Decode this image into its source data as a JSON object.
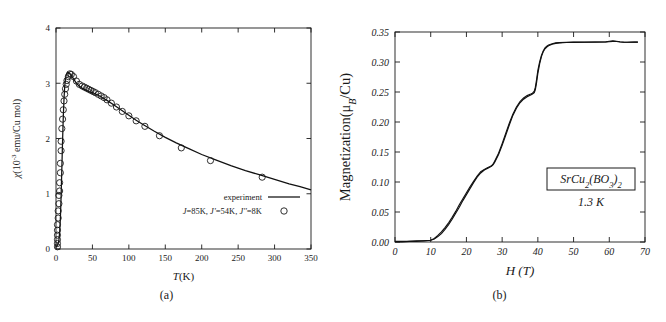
{
  "figure": {
    "panels": [
      {
        "caption": "(a)"
      },
      {
        "caption": "(b)"
      }
    ]
  },
  "chart_data": [
    {
      "type": "line",
      "panel": "(a)",
      "title": "",
      "xlabel": "T(K)",
      "ylabel": "χ(10⁻³ emu/Cu mol)",
      "ylabel_parts": {
        "symbol": "χ",
        "rest": "(10",
        "exponent": "-3",
        "tail": " emu/Cu mol)"
      },
      "xlim": [
        0,
        350
      ],
      "ylim": [
        0,
        4
      ],
      "xticks": [
        0,
        50,
        100,
        150,
        200,
        250,
        300,
        350
      ],
      "yticks": [
        0,
        1,
        2,
        3,
        4
      ],
      "grid": false,
      "legend_position": "lower-right",
      "legend": [
        {
          "label": "experiment",
          "marker": "line"
        },
        {
          "label": "J=85K, J'=54K, J''=8K",
          "marker": "circle"
        }
      ],
      "series": [
        {
          "name": "experiment",
          "style": "solid-line",
          "x": [
            0,
            1,
            2,
            3,
            4,
            5,
            6,
            7,
            8,
            9,
            10,
            11,
            12,
            13,
            14,
            15,
            16,
            18,
            20,
            22,
            25,
            28,
            31,
            35,
            40,
            45,
            50,
            55,
            60,
            65,
            70,
            80,
            90,
            100,
            110,
            120,
            135,
            150,
            165,
            180,
            200,
            220,
            240,
            260,
            280,
            300,
            320,
            335,
            350
          ],
          "y": [
            0.04,
            0.05,
            0.07,
            0.1,
            0.16,
            0.3,
            0.55,
            0.95,
            1.45,
            1.95,
            2.4,
            2.72,
            2.95,
            3.08,
            3.15,
            3.18,
            3.2,
            3.19,
            3.16,
            3.12,
            3.06,
            3.0,
            2.96,
            2.92,
            2.88,
            2.85,
            2.83,
            2.8,
            2.77,
            2.73,
            2.69,
            2.6,
            2.51,
            2.42,
            2.33,
            2.25,
            2.13,
            2.02,
            1.92,
            1.83,
            1.71,
            1.61,
            1.51,
            1.42,
            1.34,
            1.26,
            1.18,
            1.13,
            1.07
          ]
        },
        {
          "name": "J=85K, J'=54K, J''=8K",
          "style": "open-circles",
          "x": [
            2,
            2,
            2,
            2,
            2,
            2,
            3,
            3,
            4,
            4,
            5,
            5,
            6,
            6,
            7,
            7,
            8,
            9,
            10,
            11,
            12,
            13,
            14,
            15,
            17,
            19,
            21,
            24,
            28,
            32,
            36,
            39,
            42,
            45,
            48,
            51,
            54,
            58,
            62,
            66,
            70,
            76,
            83,
            91,
            100,
            110,
            122,
            142,
            172,
            212,
            283
          ],
          "y": [
            0.04,
            0.1,
            0.17,
            0.25,
            0.34,
            0.44,
            0.56,
            0.69,
            0.82,
            0.97,
            1.05,
            1.2,
            1.38,
            1.55,
            1.78,
            1.95,
            2.18,
            2.35,
            2.52,
            2.68,
            2.8,
            2.9,
            2.98,
            3.05,
            3.12,
            3.17,
            3.16,
            3.12,
            3.04,
            2.98,
            2.95,
            2.93,
            2.91,
            2.89,
            2.87,
            2.85,
            2.83,
            2.8,
            2.77,
            2.74,
            2.7,
            2.64,
            2.57,
            2.49,
            2.41,
            2.32,
            2.22,
            2.05,
            1.83,
            1.6,
            1.3
          ]
        }
      ]
    },
    {
      "type": "line",
      "panel": "(b)",
      "title": "",
      "xlabel": "H (T)",
      "ylabel": "Magnetization(μ_B/Cu)",
      "ylabel_parts": {
        "head": "Magnetization(",
        "mu": "μ",
        "sub": "B",
        "tail": "/Cu)"
      },
      "xlim": [
        0,
        70
      ],
      "ylim": [
        0.0,
        0.35
      ],
      "xticks": [
        0,
        10,
        20,
        30,
        40,
        50,
        60,
        70
      ],
      "yticks": [
        "0.00",
        "0.05",
        "0.10",
        "0.15",
        "0.20",
        "0.25",
        "0.30",
        "0.35"
      ],
      "ytick_values": [
        0.0,
        0.05,
        0.1,
        0.15,
        0.2,
        0.25,
        0.3,
        0.35
      ],
      "grid": false,
      "annotations": [
        {
          "text": "SrCu2(BO3)2",
          "boxed": true,
          "formula": [
            {
              "t": "SrCu",
              "sub": false
            },
            {
              "t": "2",
              "sub": true
            },
            {
              "t": "(BO",
              "sub": false
            },
            {
              "t": "3",
              "sub": true
            },
            {
              "t": ")",
              "sub": false
            },
            {
              "t": "2",
              "sub": true
            }
          ]
        },
        {
          "text": "1.3 K",
          "boxed": false
        }
      ],
      "series": [
        {
          "name": "up-sweep",
          "style": "solid-line",
          "x": [
            0,
            2,
            4,
            6,
            8,
            10,
            11,
            12,
            13,
            14,
            15,
            16,
            17,
            18,
            19,
            20,
            21,
            22,
            23,
            24,
            25,
            26,
            26.5,
            27,
            27.5,
            28,
            29,
            30,
            31,
            32,
            33,
            34,
            35,
            36,
            37,
            38,
            38.5,
            39,
            39.3,
            39.6,
            40,
            40.5,
            41,
            41.5,
            42,
            42.5,
            43,
            44,
            45,
            46,
            48,
            50,
            53,
            56,
            59,
            60,
            61,
            62,
            63,
            64,
            65,
            66,
            67,
            68
          ],
          "y": [
            0.001,
            0.001,
            0.001,
            0.002,
            0.002,
            0.003,
            0.005,
            0.009,
            0.014,
            0.021,
            0.029,
            0.038,
            0.048,
            0.058,
            0.069,
            0.079,
            0.089,
            0.099,
            0.108,
            0.115,
            0.12,
            0.123,
            0.1245,
            0.126,
            0.129,
            0.134,
            0.146,
            0.161,
            0.178,
            0.195,
            0.211,
            0.223,
            0.232,
            0.238,
            0.242,
            0.245,
            0.2465,
            0.249,
            0.254,
            0.264,
            0.281,
            0.297,
            0.309,
            0.317,
            0.322,
            0.325,
            0.327,
            0.3295,
            0.331,
            0.3318,
            0.3325,
            0.3328,
            0.333,
            0.3331,
            0.3333,
            0.3338,
            0.3344,
            0.3341,
            0.3334,
            0.333,
            0.3329,
            0.333,
            0.3331,
            0.3331
          ]
        },
        {
          "name": "down-sweep",
          "style": "solid-line",
          "x": [
            0,
            2,
            4,
            6,
            8,
            10,
            11,
            12,
            13,
            14,
            15,
            16,
            17,
            18,
            19,
            20,
            21,
            22,
            23,
            24,
            25,
            26,
            26.5,
            27,
            27.5,
            28,
            29,
            30,
            31,
            32,
            33,
            34,
            35,
            36,
            37,
            38,
            38.5,
            39,
            39.3,
            39.6,
            40,
            40.5,
            41,
            41.5,
            42,
            42.5,
            43,
            44,
            45,
            46,
            48,
            50,
            53,
            56,
            59,
            60,
            61,
            62,
            63,
            64,
            65,
            66,
            67,
            68
          ],
          "y": [
            0.0,
            0.0,
            0.001,
            0.001,
            0.002,
            0.003,
            0.006,
            0.011,
            0.017,
            0.024,
            0.032,
            0.041,
            0.051,
            0.062,
            0.072,
            0.082,
            0.092,
            0.101,
            0.11,
            0.117,
            0.121,
            0.124,
            0.1255,
            0.127,
            0.13,
            0.136,
            0.148,
            0.164,
            0.181,
            0.198,
            0.213,
            0.225,
            0.234,
            0.24,
            0.244,
            0.2465,
            0.248,
            0.2515,
            0.258,
            0.269,
            0.286,
            0.3,
            0.311,
            0.3185,
            0.3235,
            0.3265,
            0.3285,
            0.3305,
            0.3318,
            0.3324,
            0.3329,
            0.3331,
            0.3332,
            0.3333,
            0.3336,
            0.3345,
            0.3352,
            0.3346,
            0.3337,
            0.3331,
            0.333,
            0.3331,
            0.3332,
            0.3332
          ]
        }
      ]
    }
  ]
}
